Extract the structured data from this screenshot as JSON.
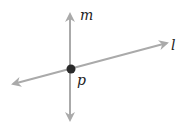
{
  "diagram": {
    "title": "",
    "colors": {
      "line": "#aaaaaa",
      "point": "#2a2a2a",
      "label": "#222222",
      "background": "#ffffff"
    },
    "lines": [
      {
        "id": "m",
        "label": "m",
        "orientation": "vertical",
        "from": [
          70,
          120
        ],
        "to": [
          70,
          13
        ],
        "arrows": "both"
      },
      {
        "id": "l",
        "label": "l",
        "orientation": "oblique",
        "from": [
          12,
          84
        ],
        "to": [
          168,
          43
        ],
        "arrows": "both"
      }
    ],
    "points": [
      {
        "id": "p",
        "label": "p",
        "position": [
          71,
          69
        ],
        "radius": 4.5
      }
    ],
    "labels": {
      "m": "m",
      "l": "l",
      "p": "p"
    }
  }
}
